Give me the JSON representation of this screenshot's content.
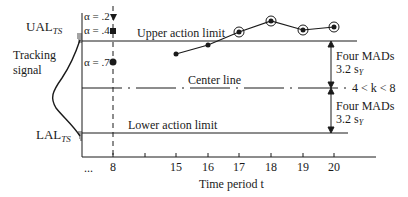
{
  "figure": {
    "left_labels": {
      "ual": "UAL",
      "ual_sub": "TS",
      "tracking_signal": [
        "Tracking",
        "signal"
      ],
      "lal": "LAL",
      "lal_sub": "TS"
    },
    "alpha_markers": [
      {
        "label": "α = .2",
        "marker": "triangle-down"
      },
      {
        "label": "α = .4",
        "marker": "square"
      },
      {
        "label": "α = .7",
        "marker": "circle"
      }
    ],
    "lines": {
      "upper": "Upper action limit",
      "center": "Center line",
      "lower": "Lower action limit"
    },
    "brackets": {
      "upper_line1": "Four MADs",
      "upper_line2": "3.2 s",
      "upper_sub": "Y",
      "k_range": "4 < k < 8",
      "lower_line1": "Four MADs",
      "lower_line2": "3.2 s",
      "lower_sub": "Y"
    },
    "x_axis": {
      "ellipsis": "...",
      "ticks": [
        "8",
        "15",
        "16",
        "17",
        "18",
        "19",
        "20"
      ],
      "label": "Time period t"
    },
    "series": [
      {
        "t": 15,
        "circled": false
      },
      {
        "t": 16,
        "circled": false
      },
      {
        "t": 17,
        "circled": true
      },
      {
        "t": 18,
        "circled": true
      },
      {
        "t": 19,
        "circled": true
      },
      {
        "t": 20,
        "circled": true
      }
    ],
    "colors": {
      "ink": "#1a1a1a",
      "background": "#ffffff"
    }
  }
}
